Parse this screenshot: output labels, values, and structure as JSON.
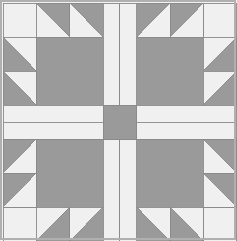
{
  "image": {
    "kind": "quilt-block-diagram",
    "pattern_name": "Bear's Paw",
    "width": 237,
    "height": 241,
    "background": "#ffffff"
  },
  "palette": {
    "dark": "#9a9a9a",
    "light": "#f0f0f0",
    "line": "#8a8a8a",
    "frame": "#b0b0b0",
    "outer_background": "#f2f2f2"
  },
  "geometry": {
    "frame": {
      "x": 1.0,
      "y": 1.0,
      "width": 234.0,
      "height": 238.0,
      "stroke_width": 1.2
    },
    "grid": {
      "origin_x": 3.0,
      "origin_y": 3.0,
      "unit_w": 16.7,
      "unit_h": 17.0,
      "cols": 14,
      "rows": 14,
      "description": "14x14 unit grid; each quadrant is 7x7 units"
    },
    "stroke_width": 0.9
  },
  "structure": {
    "quadrants": [
      {
        "id": "top-left",
        "flip_x": false,
        "flip_y": false
      },
      {
        "id": "top-right",
        "flip_x": true,
        "flip_y": false
      },
      {
        "id": "bottom-left",
        "flip_x": false,
        "flip_y": true
      },
      {
        "id": "bottom-right",
        "flip_x": true,
        "flip_y": true
      }
    ],
    "quadrant_units": {
      "corner_square": {
        "col": 0,
        "row": 0,
        "w": 2,
        "h": 2,
        "fill": "light"
      },
      "paw_square": {
        "col": 2,
        "row": 2,
        "w": 4,
        "h": 4,
        "fill": "dark"
      },
      "sash_vertical": {
        "col": 6,
        "row": 0,
        "w": 1,
        "h": 6,
        "fill": "light"
      },
      "sash_horizontal": {
        "col": 0,
        "row": 6,
        "w": 7,
        "h": 1,
        "fill": "light"
      },
      "top_triangles": [
        {
          "col": 2,
          "row": 0,
          "w": 2,
          "h": 2,
          "orientation": "top-right-dark"
        },
        {
          "col": 4,
          "row": 0,
          "w": 2,
          "h": 2,
          "orientation": "top-right-dark"
        }
      ],
      "side_triangles": [
        {
          "col": 0,
          "row": 2,
          "w": 2,
          "h": 2,
          "orientation": "bottom-left-dark"
        },
        {
          "col": 0,
          "row": 4,
          "w": 2,
          "h": 2,
          "orientation": "bottom-left-dark"
        }
      ],
      "elbow_triangle": {
        "col": 6,
        "row": 6,
        "w": 0,
        "h": 0,
        "present": false
      }
    },
    "center": {
      "square": {
        "col": 6,
        "row": 6,
        "w": 2,
        "h": 2,
        "fill": "dark"
      },
      "label": "center-square"
    },
    "notes": "Dark half-square triangles form the claws; light sashing forms a cross with a dark center square."
  },
  "legend": {
    "dark_label": "dark fabric",
    "light_label": "light fabric"
  }
}
